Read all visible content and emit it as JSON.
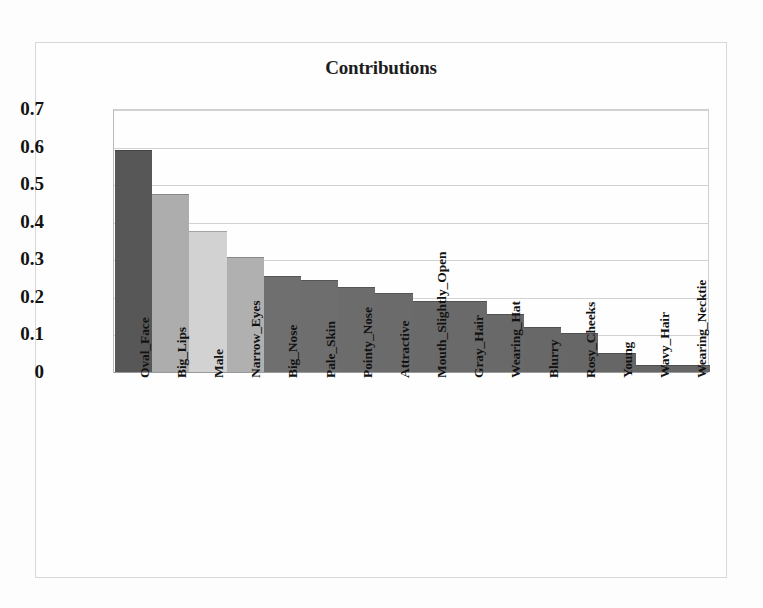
{
  "chart_data": {
    "type": "bar",
    "title": "Contributions",
    "xlabel": "",
    "ylabel": "",
    "ylim": [
      0,
      0.7
    ],
    "yticks": [
      "0",
      "0.1",
      "0.2",
      "0.3",
      "0.4",
      "0.5",
      "0.6",
      "0.7"
    ],
    "ytick_values": [
      0,
      0.1,
      0.2,
      0.3,
      0.4,
      0.5,
      0.6,
      0.7
    ],
    "grid": true,
    "legend": "none",
    "categories": [
      "Oval_Face",
      "Big_Lips",
      "Male",
      "Narrow_Eyes",
      "Big_Nose",
      "Pale_Skin",
      "Pointy_Nose",
      "Attractive",
      "Mouth_Slightly_Open",
      "Gray_Hair",
      "Wearing_Hat",
      "Blurry",
      "Rosy_Cheeks",
      "Young",
      "Wavy_Hair",
      "Wearing_Necktie"
    ],
    "values": [
      0.59,
      0.475,
      0.375,
      0.305,
      0.255,
      0.245,
      0.225,
      0.21,
      0.19,
      0.19,
      0.155,
      0.12,
      0.105,
      0.05,
      0.02,
      0.02
    ],
    "bar_colors": [
      "#575757",
      "#adadad",
      "#d2d2d2",
      "#b0b0b0",
      "#6f6f6f",
      "#6e6e6e",
      "#6c6c6c",
      "#6b6b6b",
      "#6a6a6a",
      "#6a6a6a",
      "#696969",
      "#686868",
      "#676767",
      "#666666",
      "#666666",
      "#666666"
    ]
  },
  "colors": {
    "background": "#fdfdfd",
    "frame_border": "#d8d8d8",
    "gridline": "#d2d2d2",
    "axis": "#9a9a9a",
    "text": "#121212"
  }
}
